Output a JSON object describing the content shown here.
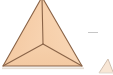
{
  "figure": {
    "title": "Triangle divided into three regions by medians from the centroid",
    "caption": "",
    "background_color": "#ffffff",
    "canvas": {
      "width": 113,
      "height": 75
    }
  },
  "shape": {
    "name": "triangle",
    "fill_color": "#f7d3b0",
    "fill_color_shaded": "#f2c7a0",
    "stroke_color": "#8a6346",
    "stroke_width": 1.1,
    "vertices": [
      {
        "label": "apex",
        "x": 42,
        "y": -3
      },
      {
        "label": "bottom-left",
        "x": 3,
        "y": 66
      },
      {
        "label": "bottom-right",
        "x": 82,
        "y": 66
      }
    ],
    "centroid": {
      "label": "centroid",
      "x": 43,
      "y": 44
    }
  },
  "medians": {
    "stroke_color": "#8a6346",
    "stroke_width": 1.1,
    "segments": [
      {
        "name": "median-to-apex",
        "from": "centroid",
        "to": "apex"
      },
      {
        "name": "median-to-bottom-left",
        "from": "centroid",
        "to": "bottom-left"
      },
      {
        "name": "median-to-bottom-right",
        "from": "centroid",
        "to": "bottom-right"
      }
    ]
  },
  "regions": [
    {
      "name": "region-left",
      "fill": "#f4cba6"
    },
    {
      "name": "region-right",
      "fill": "#f8d6b4"
    },
    {
      "name": "region-bottom",
      "fill": "#f6d0ab"
    }
  ],
  "artifacts": {
    "dash_mark": {
      "name": "dash-mark",
      "x": 88,
      "y": 32,
      "width": 10,
      "height": 1,
      "color": "#b8b8b8"
    },
    "partial_figure": {
      "name": "partial-adjacent-figure",
      "color": "#c3a890",
      "x": 99,
      "y": 58
    }
  },
  "baseline": {
    "name": "base-shadow",
    "color": "#ded3c6",
    "y": 68
  }
}
